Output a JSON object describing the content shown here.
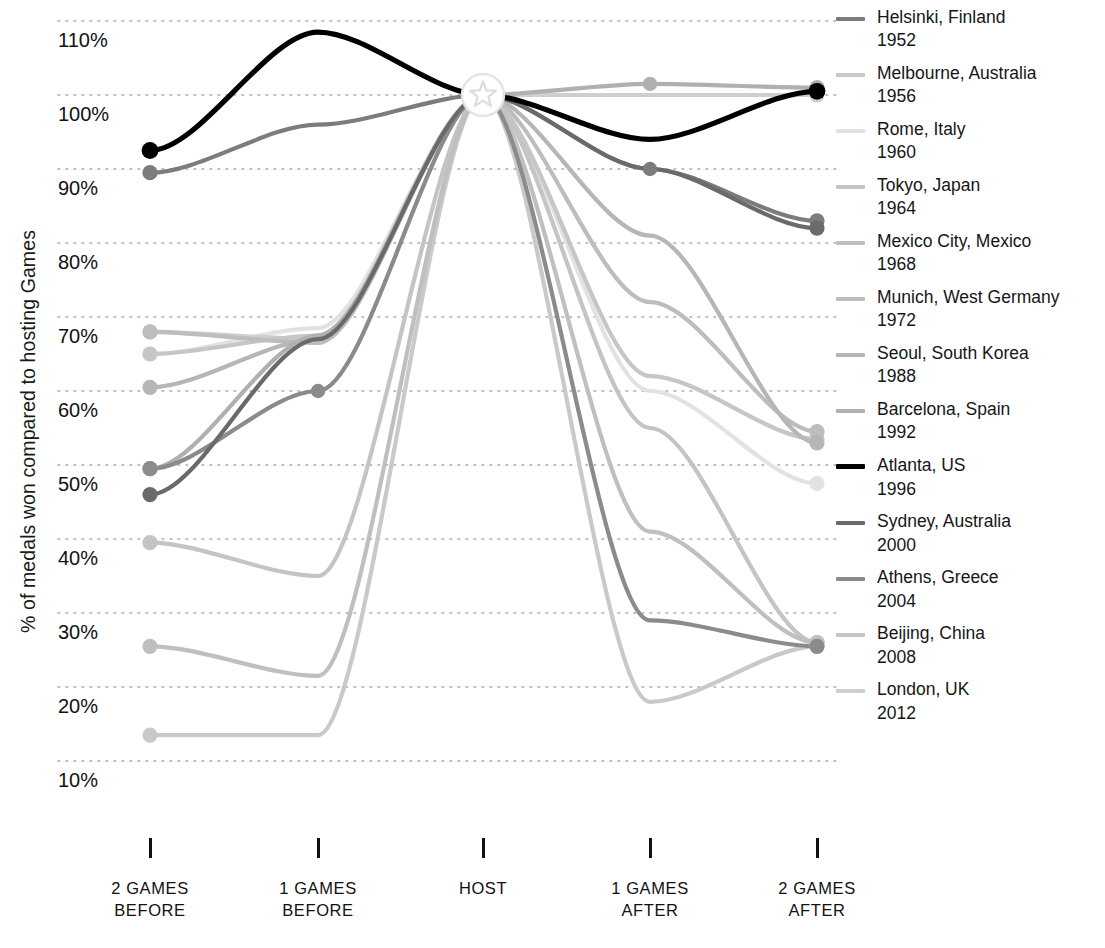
{
  "axis": {
    "y_title": "% of medals won compared to hosting Games",
    "y_ticks": [
      "110%",
      "100%",
      "90%",
      "80%",
      "70%",
      "60%",
      "50%",
      "40%",
      "30%",
      "20%",
      "10%"
    ],
    "x_ticks": [
      {
        "line1": "2 GAMES",
        "line2": "BEFORE"
      },
      {
        "line1": "1 GAMES",
        "line2": "BEFORE"
      },
      {
        "line1": "HOST",
        "line2": ""
      },
      {
        "line1": "1 GAMES",
        "line2": "AFTER"
      },
      {
        "line1": "2 GAMES",
        "line2": "AFTER"
      }
    ]
  },
  "legend": {
    "items": [
      {
        "city": "Helsinki, Finland",
        "year": "1952",
        "color": "#7c7c7c"
      },
      {
        "city": "Melbourne, Australia",
        "year": "1956",
        "color": "#c9c9c9"
      },
      {
        "city": "Rome, Italy",
        "year": "1960",
        "color": "#e2e2e2"
      },
      {
        "city": "Tokyo, Japan",
        "year": "1964",
        "color": "#c4c4c4"
      },
      {
        "city": "Mexico City, Mexico",
        "year": "1968",
        "color": "#bfbfbf"
      },
      {
        "city": "Munich, West Germany",
        "year": "1972",
        "color": "#bdbdbd"
      },
      {
        "city": "Seoul, South Korea",
        "year": "1988",
        "color": "#b6b6b6"
      },
      {
        "city": "Barcelona, Spain",
        "year": "1992",
        "color": "#b0b0b0"
      },
      {
        "city": "Atlanta, US",
        "year": "1996",
        "color": "#000000"
      },
      {
        "city": "Sydney, Australia",
        "year": "2000",
        "color": "#6a6a6a"
      },
      {
        "city": "Athens, Greece",
        "year": "2004",
        "color": "#8b8b8b"
      },
      {
        "city": "Beijing, China",
        "year": "2008",
        "color": "#c6c6c6"
      },
      {
        "city": "London, UK",
        "year": "2012",
        "color": "#cfcfcf"
      }
    ]
  },
  "chart_data": {
    "type": "line",
    "title": "",
    "xlabel": "",
    "ylabel": "% of medals won compared to hosting Games",
    "categories": [
      "2 GAMES BEFORE",
      "1 GAMES BEFORE",
      "HOST",
      "1 GAMES AFTER",
      "2 GAMES AFTER"
    ],
    "ylim": [
      5,
      113
    ],
    "ytick_values": [
      110,
      100,
      90,
      80,
      70,
      60,
      50,
      40,
      30,
      20,
      10
    ],
    "grid": "horizontal-dotted",
    "legend_position": "right",
    "host_marker": "star",
    "series": [
      {
        "name": "Helsinki, Finland 1952",
        "year": 1952,
        "color": "#7c7c7c",
        "values": [
          89.5,
          96.0,
          100,
          90.0,
          83.0
        ]
      },
      {
        "name": "Melbourne, Australia 1956",
        "year": 1956,
        "color": "#c9c9c9",
        "values": [
          13.5,
          13.5,
          100,
          18.0,
          25.5
        ]
      },
      {
        "name": "Rome, Italy 1960",
        "year": 1960,
        "color": "#e2e2e2",
        "values": [
          65.0,
          68.5,
          100,
          60.0,
          47.5
        ]
      },
      {
        "name": "Tokyo, Japan 1964",
        "year": 1964,
        "color": "#c4c4c4",
        "values": [
          39.5,
          35.0,
          100,
          55.0,
          26.0
        ]
      },
      {
        "name": "Mexico City, Mexico 1968",
        "year": 1968,
        "color": "#bfbfbf",
        "values": [
          25.5,
          21.5,
          100,
          41.0,
          26.0
        ]
      },
      {
        "name": "Munich, West Germany 1972",
        "year": 1972,
        "color": "#bdbdbd",
        "values": [
          68.0,
          66.5,
          100,
          72.0,
          54.5
        ]
      },
      {
        "name": "Seoul, South Korea 1988",
        "year": 1988,
        "color": "#b6b6b6",
        "values": [
          60.5,
          67.0,
          100,
          81.0,
          53.0
        ]
      },
      {
        "name": "Barcelona, Spain 1992",
        "year": 1992,
        "color": "#b0b0b0",
        "values": [
          49.5,
          67.5,
          100,
          101.5,
          101.0
        ]
      },
      {
        "name": "Atlanta, US 1996",
        "year": 1996,
        "color": "#000000",
        "values": [
          92.5,
          108.5,
          100,
          94.0,
          100.5
        ]
      },
      {
        "name": "Sydney, Australia 2000",
        "year": 2000,
        "color": "#6a6a6a",
        "values": [
          46.0,
          67.0,
          100,
          90.0,
          82.0
        ]
      },
      {
        "name": "Athens, Greece 2004",
        "year": 2004,
        "color": "#8b8b8b",
        "values": [
          49.5,
          60.0,
          100,
          29.0,
          25.5
        ]
      },
      {
        "name": "Beijing, China 2008",
        "year": 2008,
        "color": "#c6c6c6",
        "values": [
          65.0,
          67.5,
          100,
          62.0,
          53.5
        ]
      },
      {
        "name": "London, UK 2012",
        "year": 2012,
        "color": "#cfcfcf",
        "values": [
          68.0,
          67.0,
          100,
          100,
          100
        ]
      }
    ]
  }
}
